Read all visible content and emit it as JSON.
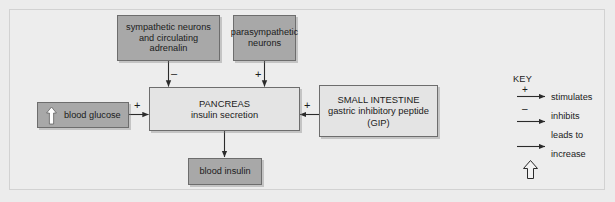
{
  "diagram": {
    "background_color": "#ececec",
    "node_fill_gray": "#a8a8a8",
    "node_fill_light": "#e4e4e4",
    "line_color": "#333333"
  },
  "nodes": {
    "sympathetic": {
      "text": "sympathetic neurons\nand circulating\nadrenalin"
    },
    "parasympathetic": {
      "text": "parasympathetic\nneurons"
    },
    "blood_glucose": {
      "text": "blood glucose",
      "icon": "up-arrow-increase"
    },
    "pancreas": {
      "text": "PANCREAS\ninsulin secretion"
    },
    "small_intestine": {
      "text": "SMALL INTESTINE\ngastric inhibitory peptide\n(GIP)"
    },
    "blood_insulin": {
      "text": "blood insulin"
    }
  },
  "edges": {
    "sympathetic_to_pancreas": {
      "sign": "–",
      "meaning": "inhibits"
    },
    "parasympathetic_to_pancreas": {
      "sign": "+",
      "meaning": "stimulates"
    },
    "blood_glucose_to_pancreas": {
      "sign": "+",
      "meaning": "stimulates"
    },
    "small_intestine_to_pancreas": {
      "sign": "+",
      "meaning": "stimulates"
    },
    "pancreas_to_blood_insulin": {
      "sign": "",
      "meaning": "leads to"
    }
  },
  "key": {
    "title": "KEY",
    "items": [
      {
        "sign": "+",
        "label": "stimulates",
        "glyph": "arrow-right"
      },
      {
        "sign": "–",
        "label": "inhibits",
        "glyph": "arrow-right"
      },
      {
        "sign": "",
        "label": "leads to",
        "glyph": "arrow-right"
      },
      {
        "sign": "",
        "label": "increase",
        "glyph": "up-arrow-outline"
      }
    ]
  }
}
